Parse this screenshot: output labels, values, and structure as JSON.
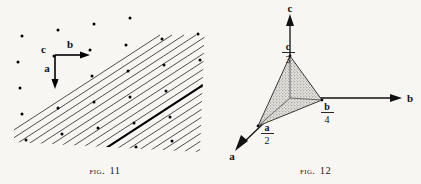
{
  "page": {
    "background_color": "#f7f6f2",
    "ink_color": "#111111"
  },
  "figures": [
    {
      "id": "fig-11",
      "caption_word": "Fig.",
      "caption_number": "11",
      "description": "Lattice plane trace diagram: parallel hatched lattice lines with lattice points, one line emphasized",
      "axis_labels": {
        "a": "a",
        "b": "b",
        "c": "c"
      },
      "hatch": {
        "angle_degrees": 33,
        "line_color": "#3a3a3a",
        "emphasized_line_color": "#000000",
        "lattice_point_color": "#000000"
      }
    },
    {
      "id": "fig-12",
      "caption_word": "Fig.",
      "caption_number": "12",
      "description": "Crystallographic axes with a stippled plane intercepting the axes at fractional intercepts",
      "axis_labels": {
        "a": "a",
        "b": "b",
        "c": "c"
      },
      "intercepts": [
        {
          "axis": "a",
          "numerator": "a",
          "denominator": "2"
        },
        {
          "axis": "b",
          "numerator": "b",
          "denominator": "4"
        },
        {
          "axis": "c",
          "numerator": "c",
          "denominator": "3"
        }
      ],
      "plane_fill_color": "#c9c6c0",
      "axis_color": "#111111"
    }
  ]
}
